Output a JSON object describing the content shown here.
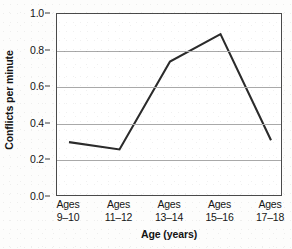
{
  "chart_data": {
    "type": "line",
    "title": "",
    "xlabel": "Age (years)",
    "ylabel": "Conflicts per minute",
    "categories": [
      "Ages\n9–10",
      "Ages\n11–12",
      "Ages\n13–14",
      "Ages\n15–16",
      "Ages\n17–18"
    ],
    "category_lines": [
      [
        "Ages",
        "9–10"
      ],
      [
        "Ages",
        "11–12"
      ],
      [
        "Ages",
        "13–14"
      ],
      [
        "Ages",
        "15–16"
      ],
      [
        "Ages",
        "17–18"
      ]
    ],
    "values": [
      0.3,
      0.26,
      0.74,
      0.89,
      0.31
    ],
    "ylim": [
      0.0,
      1.0
    ],
    "ytick_labels": [
      "0.0",
      "0.2",
      "0.4",
      "0.6",
      "0.8",
      "1.0"
    ],
    "ytick_values": [
      0.0,
      0.2,
      0.4,
      0.6,
      0.8,
      1.0
    ],
    "grid": "horizontal",
    "legend": "none",
    "markers": "none",
    "line_color": "#2b2b2b",
    "grid_color": "#a9a9a9",
    "frame_color": "#4a4a4a"
  },
  "axis": {
    "y_title": "Conflicts per minute",
    "x_title": "Age (years)"
  }
}
